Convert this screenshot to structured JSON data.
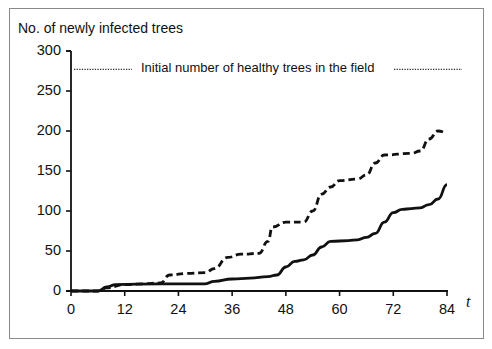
{
  "chart_data": {
    "type": "line",
    "title": "",
    "ylabel": "No. of newly infected trees",
    "xlabel": "t",
    "xlim": [
      0,
      84
    ],
    "ylim": [
      0,
      300
    ],
    "xticks": [
      0,
      12,
      24,
      36,
      48,
      60,
      72,
      84
    ],
    "yticks": [
      0,
      50,
      100,
      150,
      200,
      250,
      300
    ],
    "grid": false,
    "legend": null,
    "annotations": [
      {
        "text": "Initial number of healthy trees in the field",
        "y": 277,
        "style": "dotted horizontal reference line"
      }
    ],
    "reference_line": {
      "y": 277,
      "label": "Initial number of healthy trees in the field"
    },
    "series": [
      {
        "name": "dashed",
        "style": "dashed",
        "x": [
          0,
          6,
          8,
          12,
          16,
          20,
          22,
          26,
          30,
          32,
          35,
          38,
          42,
          44,
          45,
          48,
          52,
          54,
          56,
          58,
          60,
          64,
          66,
          68,
          70,
          76,
          78,
          80,
          82,
          84
        ],
        "values": [
          0,
          0,
          4,
          8,
          9,
          10,
          20,
          22,
          23,
          28,
          42,
          46,
          47,
          62,
          80,
          86,
          86,
          100,
          121,
          130,
          138,
          140,
          145,
          160,
          170,
          172,
          175,
          190,
          200,
          198
        ]
      },
      {
        "name": "solid",
        "style": "solid",
        "x": [
          0,
          6,
          8,
          10,
          20,
          30,
          32,
          36,
          40,
          44,
          46,
          48,
          50,
          52,
          54,
          56,
          58,
          62,
          64,
          66,
          68,
          70,
          72,
          74,
          76,
          78,
          80,
          82,
          84
        ],
        "values": [
          0,
          0,
          5,
          8,
          9,
          9,
          12,
          15,
          16,
          18,
          20,
          30,
          37,
          39,
          45,
          55,
          62,
          63,
          64,
          67,
          72,
          86,
          98,
          102,
          103,
          104,
          108,
          115,
          133
        ]
      }
    ]
  },
  "labels": {
    "ylabel": "No. of newly infected trees",
    "ref": "Initial number of healthy trees in the field",
    "xvar": "t",
    "yticks": [
      "300",
      "250",
      "200",
      "150",
      "100",
      "50",
      "0"
    ],
    "xticks": [
      "0",
      "12",
      "24",
      "36",
      "48",
      "60",
      "72",
      "84"
    ]
  }
}
